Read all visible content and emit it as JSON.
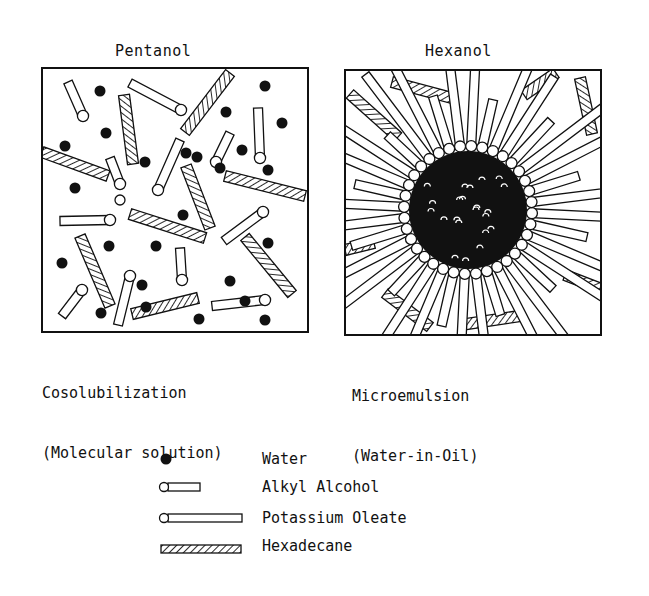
{
  "left_panel": {
    "title": "Pentanol",
    "caption_line1": "Cosolubilization",
    "caption_line2": "(Molecular solution)",
    "box": {
      "x": 42,
      "y": 68,
      "w": 266,
      "h": 264
    },
    "water": [
      [
        100,
        91
      ],
      [
        145,
        162
      ],
      [
        226,
        112
      ],
      [
        265,
        86
      ],
      [
        282,
        123
      ],
      [
        242,
        150
      ],
      [
        268,
        170
      ],
      [
        106,
        133
      ],
      [
        65,
        146
      ],
      [
        75,
        188
      ],
      [
        186,
        153
      ],
      [
        197,
        157
      ],
      [
        156,
        246
      ],
      [
        109,
        246
      ],
      [
        62,
        263
      ],
      [
        183,
        215
      ],
      [
        268,
        243
      ],
      [
        230,
        281
      ],
      [
        245,
        301
      ],
      [
        199,
        319
      ],
      [
        265,
        320
      ],
      [
        101,
        313
      ],
      [
        146,
        307
      ],
      [
        142,
        285
      ],
      [
        220,
        168
      ]
    ],
    "alcohol": [
      [
        [
          68,
          82
        ],
        [
          83,
          116
        ]
      ],
      [
        [
          130,
          83
        ],
        [
          181,
          110
        ]
      ],
      [
        [
          258,
          108
        ],
        [
          260,
          158
        ]
      ],
      [
        [
          230,
          133
        ],
        [
          216,
          162
        ]
      ],
      [
        [
          110,
          158
        ],
        [
          120,
          184
        ]
      ],
      [
        [
          180,
          140
        ],
        [
          158,
          190
        ]
      ],
      [
        [
          180,
          248
        ],
        [
          182,
          280
        ]
      ],
      [
        [
          224,
          241
        ],
        [
          263,
          212
        ]
      ],
      [
        [
          62,
          316
        ],
        [
          82,
          290
        ]
      ],
      [
        [
          118,
          325
        ],
        [
          130,
          276
        ]
      ],
      [
        [
          212,
          306
        ],
        [
          265,
          300
        ]
      ],
      [
        [
          60,
          221
        ],
        [
          110,
          220
        ]
      ]
    ],
    "oleate_in_left": [],
    "hexadecane": [
      [
        [
          124,
          95
        ],
        [
          133,
          164
        ]
      ],
      [
        [
          230,
          73
        ],
        [
          185,
          132
        ]
      ],
      [
        [
          42,
          152
        ],
        [
          108,
          176
        ]
      ],
      [
        [
          186,
          166
        ],
        [
          210,
          228
        ]
      ],
      [
        [
          225,
          176
        ],
        [
          305,
          196
        ]
      ],
      [
        [
          130,
          214
        ],
        [
          205,
          238
        ]
      ],
      [
        [
          80,
          236
        ],
        [
          110,
          306
        ]
      ],
      [
        [
          245,
          237
        ],
        [
          292,
          294
        ]
      ],
      [
        [
          132,
          314
        ],
        [
          198,
          298
        ]
      ]
    ],
    "hollow_heads": [
      [
        120,
        200
      ]
    ]
  },
  "right_panel": {
    "title": "Hexanol",
    "caption_line1": "Microemulsion",
    "caption_line2": "(Water-in-Oil)",
    "box": {
      "x": 345,
      "y": 70,
      "w": 256,
      "h": 265
    },
    "core": {
      "cx": 468,
      "cy": 210,
      "r": 58
    },
    "hexadecane": [
      [
        [
          392,
          82
        ],
        [
          452,
          98
        ]
      ],
      [
        [
          350,
          94
        ],
        [
          398,
          137
        ]
      ],
      [
        [
          524,
          95
        ],
        [
          556,
          73
        ]
      ],
      [
        [
          580,
          78
        ],
        [
          592,
          134
        ]
      ],
      [
        [
          345,
          250
        ],
        [
          374,
          243
        ]
      ],
      [
        [
          604,
          290
        ],
        [
          565,
          275
        ]
      ],
      [
        [
          385,
          293
        ],
        [
          430,
          327
        ]
      ],
      [
        [
          460,
          325
        ],
        [
          520,
          316
        ]
      ]
    ]
  },
  "legend": {
    "items": [
      {
        "symbol": "water",
        "label": "Water"
      },
      {
        "symbol": "alkyl-alcohol",
        "label": "Alkyl Alcohol"
      },
      {
        "symbol": "potassium-oleate",
        "label": "Potassium Oleate"
      },
      {
        "symbol": "hexadecane",
        "label": "Hexadecane"
      }
    ]
  }
}
